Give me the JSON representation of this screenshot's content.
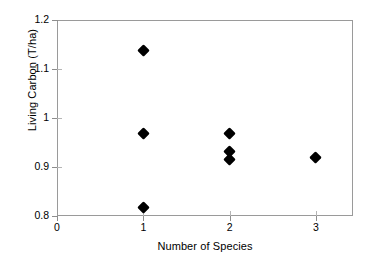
{
  "chart_data": {
    "type": "scatter",
    "title": "",
    "xlabel": "Number of Species",
    "ylabel": "Living Carbon (T/ha)",
    "xlim": [
      0,
      3.43
    ],
    "ylim": [
      0.8,
      1.2
    ],
    "xticks": [
      0,
      1,
      2,
      3
    ],
    "xtick_labels": [
      "0",
      "1",
      "2",
      "3"
    ],
    "yticks": [
      0.8,
      0.9,
      1.0,
      1.1,
      1.2
    ],
    "ytick_labels": [
      "0.8",
      "0.9",
      "1",
      "1.1",
      "1.2"
    ],
    "grid": false,
    "legend": false,
    "marker": "diamond",
    "marker_color": "#000000",
    "frame_color": "#9a9a9a",
    "background_color": "#ffffff",
    "series": [
      {
        "name": "Living Carbon",
        "points": [
          {
            "x": 1,
            "y": 1.137
          },
          {
            "x": 1,
            "y": 0.968
          },
          {
            "x": 1,
            "y": 0.818
          },
          {
            "x": 2,
            "y": 0.968
          },
          {
            "x": 2,
            "y": 0.932
          },
          {
            "x": 2,
            "y": 0.916
          },
          {
            "x": 3,
            "y": 0.92
          }
        ]
      }
    ]
  }
}
